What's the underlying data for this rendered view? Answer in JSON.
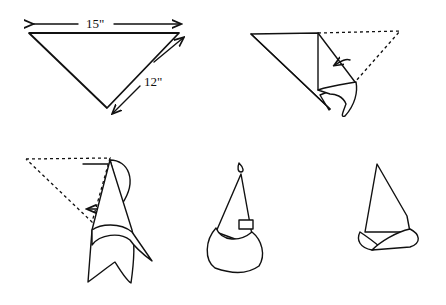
{
  "diagram": {
    "steps": [
      {
        "id": 1,
        "description": "Triangle napkin with dimensions",
        "labels": {
          "width": "15\"",
          "side": "12\""
        }
      },
      {
        "id": 2,
        "description": "Fold right corner over toward center (dashed outline shows original position)"
      },
      {
        "id": 3,
        "description": "Fold left corner over (dashed outline shows original position)"
      },
      {
        "id": 4,
        "description": "Cone shape with rolled brim and tab"
      },
      {
        "id": 5,
        "description": "Finished cone with rolled brim, angled"
      }
    ]
  },
  "colors": {
    "ink": "#111111",
    "background": "#ffffff"
  }
}
